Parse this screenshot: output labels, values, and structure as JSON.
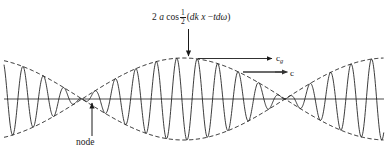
{
  "figure": {
    "background_color": "#ffffff",
    "width": 389,
    "height": 156
  },
  "annotations": {
    "formula": {
      "prefix": "2",
      "amplitude_symbol": "a",
      "function": "cos",
      "fraction_numerator": "1",
      "fraction_denominator": "2",
      "open_paren": "(",
      "term_one": "dk",
      "variable_x": "x",
      "minus": "−",
      "term_two": "tdω",
      "close_paren": ")",
      "plain_text": "2 a cos 1/2 (dk x − tdω)"
    },
    "group_velocity": {
      "symbol": "c",
      "subscript": "g",
      "plain_text": "c_g"
    },
    "phase_velocity": {
      "symbol": "c",
      "subscript": "",
      "plain_text": "c"
    },
    "node": {
      "label": "node"
    }
  },
  "colors": {
    "carrier_line": "#1a1a1a",
    "envelope_dashed": "#1a1a1a",
    "axis_line": "#4d4d4d",
    "arrow_black": "#1a1a1a",
    "arrow_gray": "#6b6b6b",
    "text": "#1a1a1a"
  },
  "chart_data": {
    "type": "line",
    "title": "",
    "xlabel": "",
    "ylabel": "",
    "axis": {
      "y_zero_pixel": 99,
      "x_start": 4,
      "x_end": 384,
      "grid": false
    },
    "envelope": {
      "amplitude_pixels": 41,
      "node_positions_px": [
        92,
        295
      ],
      "antinode_positions_px": [
        193
      ],
      "half_period_px": 203,
      "phase_offset_px": -10
    },
    "carrier": {
      "wavelength_px": 20.5,
      "cycles_visible": 19,
      "phase_offset_px": 2.5
    },
    "legend_position": "none"
  }
}
